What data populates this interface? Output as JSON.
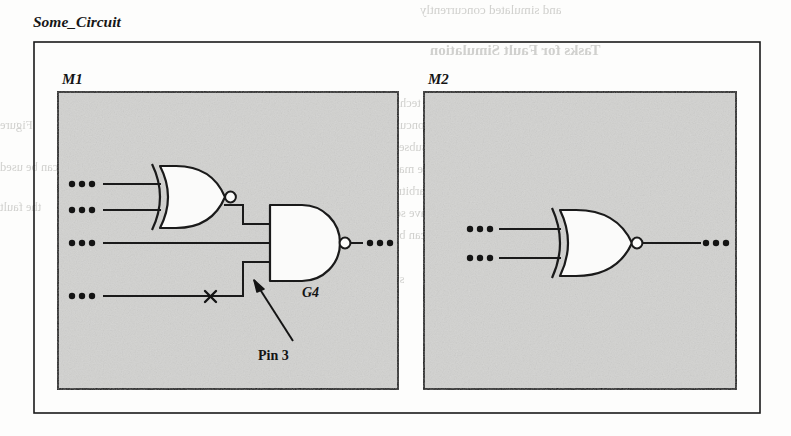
{
  "figure": {
    "title": "Some_Circuit",
    "background_color": "#fdfdfc",
    "module_fill": "#d2d2d0",
    "line_color": "#1a1a1a"
  },
  "outer_block": {
    "label": "Some_Circuit"
  },
  "modules": [
    {
      "id": "M1",
      "label": "M1",
      "gates": [
        {
          "id": "XNOR1",
          "type": "xnor-gate",
          "label": "",
          "inputs": 2,
          "inverted_output": true
        },
        {
          "id": "G4",
          "type": "nand-gate",
          "label": "G4",
          "inputs": 3,
          "inverted_output": true
        }
      ],
      "input_ports": [
        {
          "name": "port-1",
          "glyph": "•••"
        },
        {
          "name": "port-2",
          "glyph": "•••"
        },
        {
          "name": "port-3",
          "glyph": "•••"
        },
        {
          "name": "port-4",
          "glyph": "•••"
        }
      ],
      "output_ports": [
        {
          "name": "out-1",
          "glyph": "•••"
        }
      ],
      "fault_marker": {
        "symbol": "×",
        "name": "fault-x-marker"
      },
      "annotation": {
        "label": "Pin 3",
        "arrow": "points-up-left-to-g4-lower-input"
      }
    },
    {
      "id": "M2",
      "label": "M2",
      "gates": [
        {
          "id": "XNOR2",
          "type": "xnor-gate",
          "label": "",
          "inputs": 2,
          "inverted_output": true
        }
      ],
      "input_ports": [
        {
          "name": "port-1",
          "glyph": "•••"
        },
        {
          "name": "port-2",
          "glyph": "•••"
        }
      ],
      "output_ports": [
        {
          "name": "out-1",
          "glyph": "•••"
        }
      ],
      "fault_marker": null,
      "annotation": null
    }
  ],
  "bleed_text": {
    "l1": "and simulated concurrently",
    "l2": "Tasks for Fault Simulation",
    "l3": "the technique is the same as",
    "l4": "a concurrent fault simulator",
    "l5": "a subset of that used by the",
    "l6": "we may consider the same",
    "l7": "is arbitrary and can be con-",
    "l8": "ave software for this pro-",
    "l9": "alone can be worth considering",
    "l10": "in the same module",
    "l11": "simulation algorithm",
    "l12": "Figure",
    "l13": "which can be used",
    "l14": "the fault"
  }
}
